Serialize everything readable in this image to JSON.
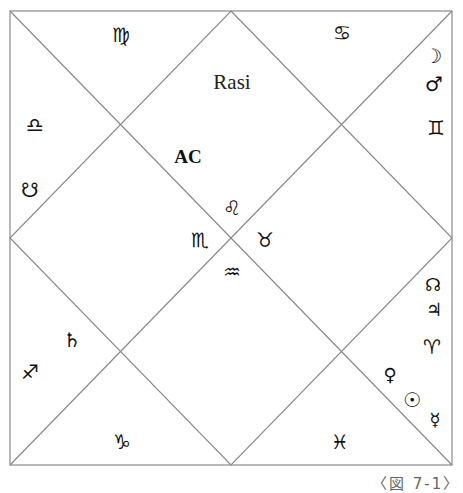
{
  "chart": {
    "title": "Rasi",
    "style": "North Indian diamond chart",
    "ascendant_label": "AC",
    "line_color": "#8a8a8a",
    "box": {
      "left": 10,
      "top": 11,
      "right": 452,
      "bottom": 465
    }
  },
  "houses": [
    {
      "id": "house-1",
      "sign": "Leo",
      "glyph": "♌",
      "x": 232,
      "y": 208,
      "planets": []
    },
    {
      "id": "house-2",
      "sign": "Virgo",
      "glyph": "♍",
      "x": 121,
      "y": 35,
      "planets": []
    },
    {
      "id": "house-3",
      "sign": "Libra",
      "glyph": "♎",
      "x": 35,
      "y": 125,
      "planets": [
        {
          "name": "Ketu",
          "glyph": "☋",
          "x": 30,
          "y": 190
        }
      ]
    },
    {
      "id": "house-4",
      "sign": "Scorpio",
      "glyph": "♏",
      "x": 200,
      "y": 240,
      "planets": []
    },
    {
      "id": "house-5",
      "sign": "Sagittarius",
      "glyph": "♐",
      "x": 30,
      "y": 372,
      "planets": [
        {
          "name": "Saturn",
          "glyph": "♄",
          "x": 72,
          "y": 340
        }
      ]
    },
    {
      "id": "house-6",
      "sign": "Capricorn",
      "glyph": "♑",
      "x": 122,
      "y": 442,
      "planets": []
    },
    {
      "id": "house-7",
      "sign": "Aquarius",
      "glyph": "♒",
      "x": 232,
      "y": 272,
      "planets": []
    },
    {
      "id": "house-8",
      "sign": "Pisces",
      "glyph": "♓",
      "x": 340,
      "y": 442,
      "planets": []
    },
    {
      "id": "house-9",
      "sign": "Aries",
      "glyph": "♈",
      "x": 432,
      "y": 347,
      "planets": [
        {
          "name": "Rahu",
          "glyph": "☊",
          "x": 433,
          "y": 285
        },
        {
          "name": "Jupiter",
          "glyph": "♃",
          "x": 434,
          "y": 310
        },
        {
          "name": "Venus",
          "glyph": "♀",
          "x": 390,
          "y": 375
        },
        {
          "name": "Sun",
          "glyph": "☉",
          "x": 412,
          "y": 400
        },
        {
          "name": "Mercury",
          "glyph": "☿",
          "x": 435,
          "y": 420
        }
      ]
    },
    {
      "id": "house-10",
      "sign": "Taurus",
      "glyph": "♉",
      "x": 265,
      "y": 240,
      "planets": []
    },
    {
      "id": "house-11",
      "sign": "Gemini",
      "glyph": "♊",
      "x": 436,
      "y": 128,
      "planets": [
        {
          "name": "Moon",
          "glyph": "☽",
          "x": 433,
          "y": 56
        },
        {
          "name": "Mars",
          "glyph": "♂",
          "x": 434,
          "y": 84
        }
      ]
    },
    {
      "id": "house-12",
      "sign": "Cancer",
      "glyph": "♋",
      "x": 342,
      "y": 33,
      "planets": []
    }
  ],
  "labels": {
    "title": {
      "text": "Rasi",
      "x": 232,
      "y": 82
    },
    "ascendant": {
      "text": "AC",
      "x": 188,
      "y": 157
    }
  },
  "caption": "〈図 7-1〉"
}
